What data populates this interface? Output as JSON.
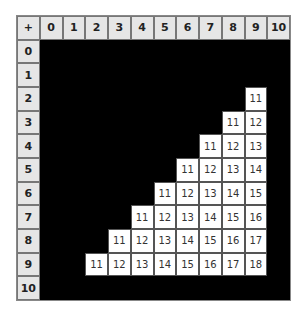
{
  "table": {
    "corner": "+",
    "columns": [
      "0",
      "1",
      "2",
      "3",
      "4",
      "5",
      "6",
      "7",
      "8",
      "9",
      "10"
    ],
    "rows": [
      "0",
      "1",
      "2",
      "3",
      "4",
      "5",
      "6",
      "7",
      "8",
      "9",
      "10"
    ],
    "show_threshold": 11,
    "colors": {
      "background": "#000000",
      "header": "#e6e6e6",
      "value_cell": "#ffffff"
    }
  }
}
